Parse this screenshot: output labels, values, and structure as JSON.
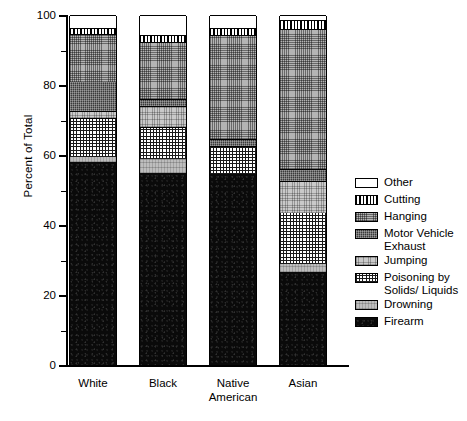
{
  "chart_data": {
    "type": "bar",
    "subtype": "stacked-bar-100-percent",
    "title": "",
    "xlabel": "",
    "ylabel": "Percent of Total",
    "ylim": [
      0,
      100
    ],
    "ytick_labels": [
      "0",
      "20",
      "40",
      "60",
      "80",
      "100"
    ],
    "ytick_values": [
      0,
      20,
      40,
      60,
      80,
      100
    ],
    "yminor_ticks": [
      10,
      30,
      50,
      70,
      90
    ],
    "grid": false,
    "legend_position": "right",
    "categories": [
      "White",
      "Black",
      "Native American",
      "Asian"
    ],
    "category_labels": [
      [
        "White"
      ],
      [
        "Black"
      ],
      [
        "Native",
        "American"
      ],
      [
        "Asian"
      ]
    ],
    "series": [
      {
        "name": "Firearm",
        "pattern": "solid-black",
        "values": [
          58.0,
          55.0,
          54.5,
          26.5
        ]
      },
      {
        "name": "Drowning",
        "pattern": "light-gray-solid",
        "values": [
          1.5,
          4.0,
          0.0,
          2.5
        ]
      },
      {
        "name": "Poisoning by Solids/ Liquids",
        "pattern": "fine-grid",
        "values": [
          11.0,
          9.0,
          8.0,
          14.5
        ]
      },
      {
        "name": "Jumping",
        "pattern": "light-gray-hatch",
        "values": [
          2.0,
          6.0,
          0.0,
          9.0
        ]
      },
      {
        "name": "Motor Vehicle Exhaust",
        "pattern": "dark-dense-hatch",
        "values": [
          8.5,
          2.0,
          2.0,
          3.5
        ]
      },
      {
        "name": "Hanging",
        "pattern": "medium-crosshatch",
        "values": [
          13.5,
          16.3,
          29.8,
          40.0
        ]
      },
      {
        "name": "Cutting",
        "pattern": "vertical-stripes",
        "values": [
          1.7,
          2.0,
          2.0,
          2.5
        ]
      },
      {
        "name": "Other",
        "pattern": "white",
        "values": [
          3.8,
          5.7,
          3.7,
          1.5
        ]
      }
    ]
  },
  "legend": {
    "items": [
      {
        "label": "Other",
        "pattern": "p-other"
      },
      {
        "label": "Cutting",
        "pattern": "p-cutting"
      },
      {
        "label": "Hanging",
        "pattern": "p-hanging"
      },
      {
        "label": "Motor Vehicle Exhaust",
        "pattern": "p-motor"
      },
      {
        "label": "Jumping",
        "pattern": "p-jumping"
      },
      {
        "label": "Poisoning by Solids/ Liquids",
        "pattern": "p-poison"
      },
      {
        "label": "Drowning",
        "pattern": "p-drowning"
      },
      {
        "label": "Firearm",
        "pattern": "p-firearm"
      }
    ]
  },
  "colors": {
    "axis": "#000000",
    "text": "#000000",
    "background": "#ffffff"
  }
}
